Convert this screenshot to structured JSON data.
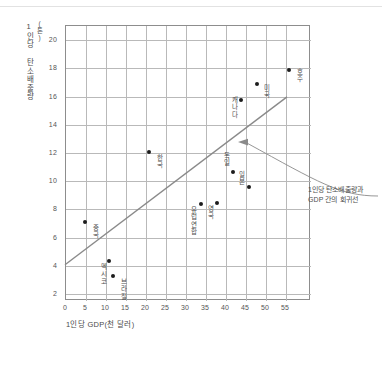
{
  "chart_data": {
    "type": "scatter",
    "title": "",
    "xlabel": "1인당 GDP(천 달러)",
    "ylabel": "1인당 탄소배출량",
    "yunit": "(톤)",
    "xlim": [
      0,
      61.25
    ],
    "ylim": [
      1.5,
      21.0
    ],
    "xticks": [
      0,
      5,
      10,
      15,
      20,
      25,
      30,
      35,
      40,
      45,
      50,
      55
    ],
    "yticks": [
      2,
      4,
      6,
      8,
      10,
      12,
      14,
      16,
      18,
      20
    ],
    "grid": true,
    "legend": "none",
    "points": [
      {
        "label": "중국",
        "x": 5,
        "y": 7.0
      },
      {
        "label": "멕시코",
        "x": 11,
        "y": 4.3
      },
      {
        "label": "브라질",
        "x": 12,
        "y": 3.2
      },
      {
        "label": "한국",
        "x": 21,
        "y": 12.0
      },
      {
        "label": "유럽연합",
        "x": 34,
        "y": 8.3
      },
      {
        "label": "영국",
        "x": 38,
        "y": 8.4
      },
      {
        "label": "독일",
        "x": 42,
        "y": 10.6
      },
      {
        "label": "캐나다",
        "x": 44,
        "y": 15.7
      },
      {
        "label": "일본",
        "x": 46,
        "y": 9.5
      },
      {
        "label": "미국",
        "x": 48,
        "y": 16.8
      },
      {
        "label": "호주",
        "x": 56,
        "y": 17.8
      }
    ],
    "regression_line": {
      "x_start": 0,
      "y_start": 4.0,
      "x_end": 55.5,
      "y_end": 15.9,
      "color": "#8a8a8a"
    },
    "annotations": [
      {
        "name": "regression-line-callout",
        "line1": "1인당 탄소배출량과",
        "line2": "GDP 간의 회귀선",
        "target_x": 43,
        "target_y": 12.7
      }
    ]
  }
}
